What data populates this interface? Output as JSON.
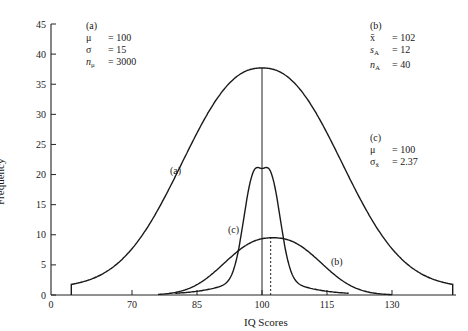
{
  "chart_data": {
    "type": "line",
    "title": "",
    "xlabel": "IQ Scores",
    "ylabel": "Frequency",
    "xlim": [
      55,
      145
    ],
    "ylim": [
      0,
      45
    ],
    "x_ticks": [
      0,
      70,
      85,
      100,
      115,
      130
    ],
    "x_tick_labels": [
      "0",
      "70",
      "85",
      "100",
      "115",
      "130"
    ],
    "y_ticks": [
      0,
      5,
      10,
      15,
      20,
      25,
      30,
      35,
      40,
      45
    ],
    "y_tick_labels": [
      "0",
      "5",
      "10",
      "15",
      "20",
      "25",
      "30",
      "35",
      "40",
      "45"
    ],
    "grid": false,
    "series": [
      {
        "name": "(a)",
        "description": "population distribution",
        "center": 100,
        "sd": 15,
        "peak": 36.5,
        "x_range": [
          56,
          144
        ]
      },
      {
        "name": "(b)",
        "description": "sample distribution",
        "center": 102,
        "sd": 12,
        "peak": 9.5,
        "x_range": [
          76,
          130
        ]
      },
      {
        "name": "(c)",
        "description": "sampling distribution of the mean",
        "center": 100,
        "sd": 2.37,
        "peak": 21,
        "x_range": [
          80,
          120
        ]
      }
    ],
    "reference_lines": [
      {
        "x": 100,
        "style": "solid",
        "to_series": "(a)"
      },
      {
        "x": 102,
        "style": "dotted",
        "to_series": "(b)"
      }
    ],
    "annotations": {
      "a": {
        "label": "(a)",
        "rows": [
          [
            "μ",
            "= 100"
          ],
          [
            "σ",
            "= 15"
          ],
          [
            "n_μ",
            "= 3000"
          ]
        ]
      },
      "b": {
        "label": "(b)",
        "rows": [
          [
            "x̄",
            "= 102"
          ],
          [
            "s_A",
            "= 12"
          ],
          [
            "n_A",
            "= 40"
          ]
        ]
      },
      "c": {
        "label": "(c)",
        "rows": [
          [
            "μ",
            "= 100"
          ],
          [
            "σ_x̄",
            "= 2.37"
          ]
        ]
      }
    }
  },
  "labels": {
    "ylabel": "Frequency",
    "xlabel": "IQ Scores",
    "curve_a": "(a)",
    "curve_b": "(b)",
    "curve_c": "(c)"
  },
  "ann_a": {
    "title": "(a)",
    "r1s": "μ",
    "r1v": "= 100",
    "r2s": "σ",
    "r2v": "= 15",
    "r3s": "n",
    "r3sub": "μ",
    "r3v": "= 3000"
  },
  "ann_b": {
    "title": "(b)",
    "r1s": "x̄",
    "r1v": "= 102",
    "r2s": "s",
    "r2sub": "A",
    "r2v": "= 12",
    "r3s": "n",
    "r3sub": "A",
    "r3v": "= 40"
  },
  "ann_c": {
    "title": "(c)",
    "r1s": "μ",
    "r1v": "= 100",
    "r2s": "σ",
    "r2sub": "x̄",
    "r2v": "= 2.37"
  }
}
